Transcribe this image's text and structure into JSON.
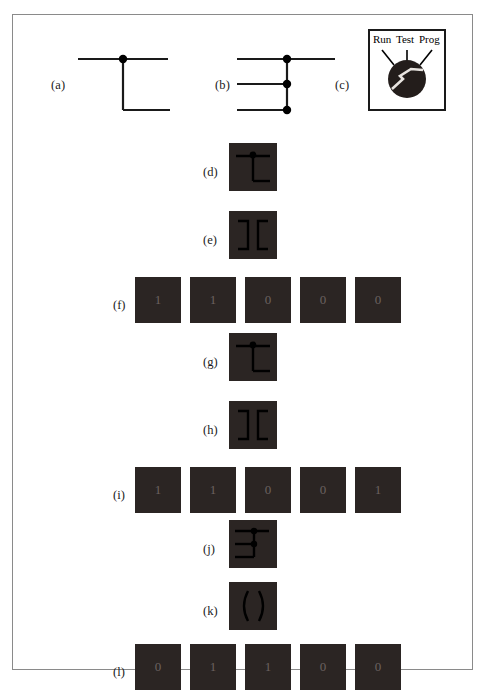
{
  "figure": {
    "panels": [
      {
        "id": "a",
        "label": "(a)",
        "kind": "junction-single"
      },
      {
        "id": "b",
        "label": "(b)",
        "kind": "junction-triple"
      },
      {
        "id": "c",
        "label": "(c)",
        "kind": "dial"
      },
      {
        "id": "d",
        "label": "(d)",
        "kind": "tile-glyph-junction-single"
      },
      {
        "id": "e",
        "label": "(e)",
        "kind": "tile-glyph-brackets"
      },
      {
        "id": "f",
        "label": "(f)",
        "kind": "tile-digit-row"
      },
      {
        "id": "g",
        "label": "(g)",
        "kind": "tile-glyph-junction-single"
      },
      {
        "id": "h",
        "label": "(h)",
        "kind": "tile-glyph-brackets"
      },
      {
        "id": "i",
        "label": "(i)",
        "kind": "tile-digit-row"
      },
      {
        "id": "j",
        "label": "(j)",
        "kind": "tile-glyph-junction-triple"
      },
      {
        "id": "k",
        "label": "(k)",
        "kind": "tile-glyph-arcs"
      },
      {
        "id": "l",
        "label": "(l)",
        "kind": "tile-digit-row"
      }
    ]
  },
  "dial": {
    "labels": {
      "run": "Run",
      "test": "Test",
      "prog": "Prog"
    },
    "pointer_position": "Test"
  },
  "digit_rows": {
    "f": [
      "1",
      "1",
      "0",
      "0",
      "0"
    ],
    "i": [
      "1",
      "1",
      "0",
      "0",
      "1"
    ],
    "l": [
      "0",
      "1",
      "1",
      "0",
      "0"
    ]
  },
  "colors": {
    "tile_fill": "#2b2523",
    "glyph_stroke": "#000000",
    "digit_text": "#6b6260",
    "panel_border": "#8a8a8a",
    "dial_border": "#1a1a1a",
    "line_stroke": "#1a1a1a"
  }
}
